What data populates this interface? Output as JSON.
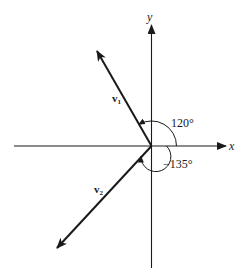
{
  "diagram": {
    "title": "",
    "axes": {
      "x_label": "x",
      "y_label": "y"
    },
    "vectors": [
      {
        "name": "v1",
        "label_main": "v",
        "label_sub": "1",
        "angle_deg": 120,
        "angle_label": "120°"
      },
      {
        "name": "v2",
        "label_main": "v",
        "label_sub": "2",
        "angle_deg": -135,
        "angle_label": "−135°"
      }
    ],
    "colors": {
      "stroke": "#1a1a1a",
      "background": "#ffffff"
    }
  }
}
